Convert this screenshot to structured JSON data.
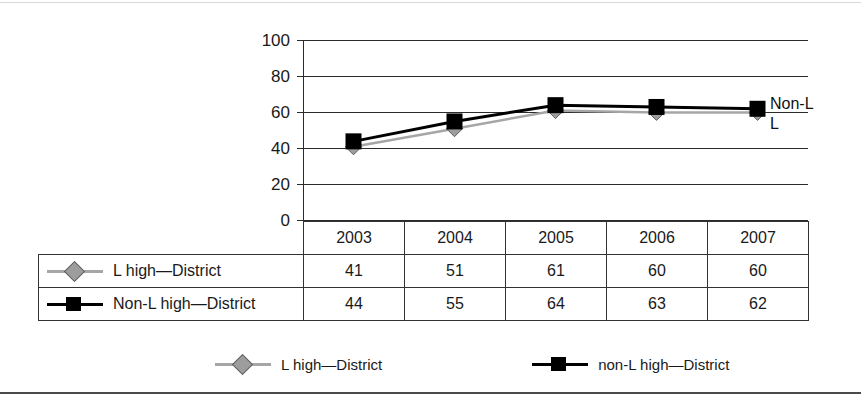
{
  "chart_data": {
    "type": "line",
    "title": "",
    "xlabel": "",
    "ylabel": "",
    "categories": [
      "2003",
      "2004",
      "2005",
      "2006",
      "2007"
    ],
    "ylim": [
      0,
      100
    ],
    "yticks": [
      0,
      20,
      40,
      60,
      80,
      100
    ],
    "grid": true,
    "legend_position": "bottom",
    "series": [
      {
        "name": "L high—District",
        "values": [
          41,
          51,
          61,
          60,
          60
        ],
        "color": "#a6a6a6",
        "marker": "diamond",
        "end_annotation": "L"
      },
      {
        "name": "Non-L high—District",
        "values": [
          44,
          55,
          64,
          63,
          62
        ],
        "color": "#000000",
        "marker": "square",
        "end_annotation": "Non-L"
      }
    ],
    "annotations": [
      {
        "text": "Non-L",
        "series": "Non-L high—District"
      },
      {
        "text": "L",
        "series": "L high—District"
      }
    ]
  },
  "axis": {
    "y_tick_labels": [
      "100",
      "80",
      "60",
      "40",
      "20",
      "0"
    ]
  },
  "table": {
    "column_headers": [
      "2003",
      "2004",
      "2005",
      "2006",
      "2007"
    ],
    "rows": [
      {
        "label": "L high—District",
        "marker": "diamond-gray",
        "values": [
          "41",
          "51",
          "61",
          "60",
          "60"
        ]
      },
      {
        "label": "Non-L high—District",
        "marker": "square-black",
        "values": [
          "44",
          "55",
          "64",
          "63",
          "62"
        ]
      }
    ]
  },
  "legend": {
    "entries": [
      {
        "label": "L high—District",
        "marker": "diamond-gray"
      },
      {
        "label": "non-L high—District",
        "marker": "square-black"
      }
    ]
  },
  "colors": {
    "series_l": "#a6a6a6",
    "series_nonl": "#000000",
    "axis": "#2b2b2b",
    "grid": "#2b2b2b",
    "border": "#333333"
  }
}
